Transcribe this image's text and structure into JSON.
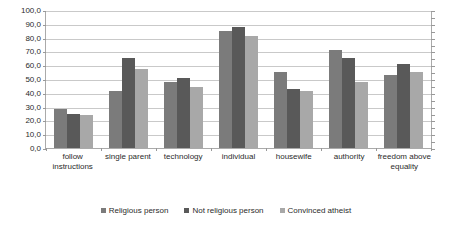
{
  "chart_data": {
    "type": "bar",
    "title": "",
    "xlabel": "",
    "ylabel": "",
    "ylim": [
      0,
      100
    ],
    "ytick_step": 10,
    "ytick_labels": [
      "100,0",
      "90,0",
      "80,0",
      "70,0",
      "60,0",
      "50,0",
      "40,0",
      "30,0",
      "20,0",
      "10,0",
      "0,0"
    ],
    "grid": true,
    "legend_position": "bottom",
    "categories": [
      "follow instructions",
      "single parent",
      "technology",
      "individual",
      "housewife",
      "authority",
      "freedom above equality"
    ],
    "series": [
      {
        "name": "Religious person",
        "color": "#7b7b7b",
        "values": [
          28,
          41,
          48,
          85,
          55,
          71,
          53
        ]
      },
      {
        "name": "Not religious person",
        "color": "#595959",
        "values": [
          25,
          65,
          51,
          88,
          43,
          65,
          61
        ]
      },
      {
        "name": "Convinced atheist",
        "color": "#a8a8a8",
        "values": [
          24,
          57,
          44,
          81,
          41,
          48,
          55
        ]
      }
    ]
  },
  "colors": {
    "gridline": "#c9c9c9",
    "axis": "#aaaaaa",
    "text": "#2b2b2b",
    "background": "#ffffff"
  }
}
